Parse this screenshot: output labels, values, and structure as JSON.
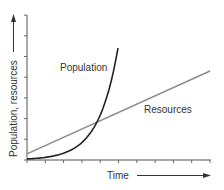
{
  "chart_data": {
    "type": "line",
    "title": "",
    "xlabel": "Time",
    "ylabel": "Population, resources",
    "xlim": [
      0,
      10
    ],
    "ylim": [
      0,
      7
    ],
    "x_ticks": 10,
    "y_ticks": 7,
    "tick_labels": "none",
    "grid": false,
    "legend": "inline labels",
    "series": [
      {
        "name": "Population",
        "shape": "exponential",
        "color": "#222222",
        "x": [
          0,
          0.5,
          1,
          1.5,
          2,
          2.5,
          3,
          3.5,
          3.77,
          4,
          4.25,
          4.5,
          4.75,
          4.97
        ],
        "values": [
          0.05,
          0.08,
          0.13,
          0.2,
          0.33,
          0.52,
          0.84,
          1.34,
          1.74,
          2.15,
          2.73,
          3.45,
          4.37,
          5.4
        ]
      },
      {
        "name": "Resources",
        "shape": "linear",
        "color": "#8a8a8a",
        "x": [
          0,
          10
        ],
        "values": [
          0.3,
          4.3
        ]
      }
    ],
    "annotations": [
      {
        "text": "Population",
        "near_series": "Population"
      },
      {
        "text": "Resources",
        "near_series": "Resources"
      }
    ]
  },
  "labels": {
    "population": "Population",
    "resources": "Resources",
    "xaxis": "Time",
    "yaxis": "Population, resources"
  }
}
